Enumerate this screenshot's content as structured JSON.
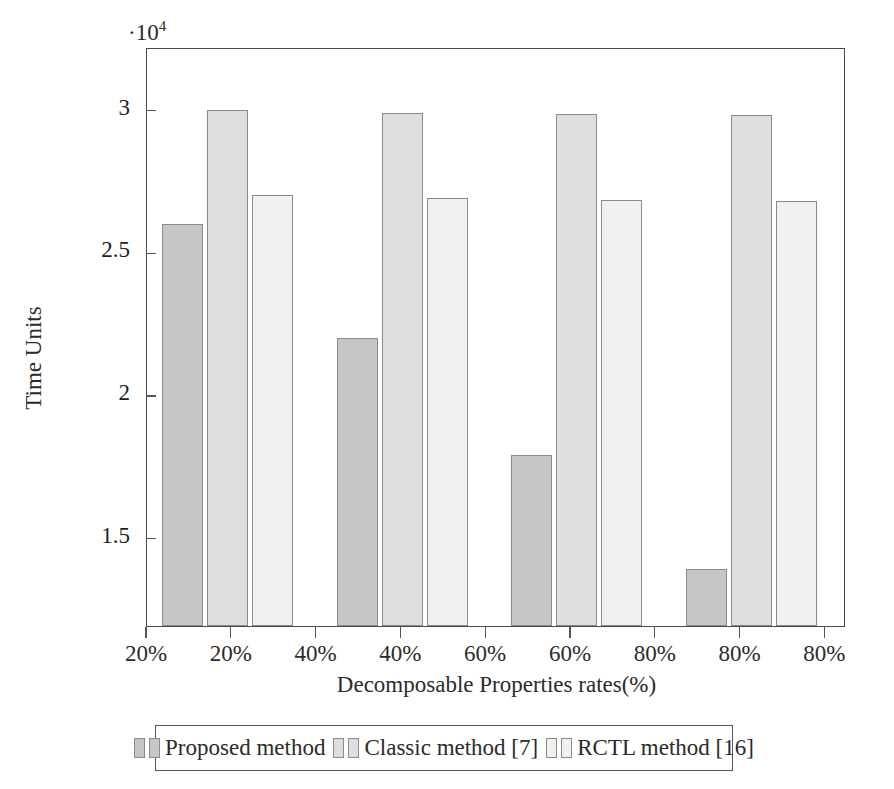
{
  "chart_data": {
    "type": "bar",
    "title": "",
    "xlabel": "Decomposable Properties rates(%)",
    "ylabel": "Time Units",
    "y_exponent": "·10",
    "y_exponent_sup": "4",
    "ylim": [
      1.19,
      3.22
    ],
    "yticks": [
      3,
      2.5,
      2,
      1.5
    ],
    "ytick_labels": [
      "3",
      "2.5",
      "2",
      "1.5"
    ],
    "xtick_labels": [
      "20%",
      "20%",
      "40%",
      "40%",
      "60%",
      "60%",
      "80%",
      "80%",
      "80%"
    ],
    "categories": [
      "20%",
      "40%",
      "60%",
      "80%"
    ],
    "grid": false,
    "legend_position": "below-axes",
    "series": [
      {
        "name": "Proposed method",
        "color": "#c6c6c6",
        "values": [
          2.6,
          2.2,
          1.79,
          1.39
        ]
      },
      {
        "name": "Classic method [7]",
        "color": "#dedede",
        "values": [
          3.0,
          2.99,
          2.985,
          2.98
        ]
      },
      {
        "name": "RCTL method [16]",
        "color": "#f1f1f1",
        "values": [
          2.7,
          2.69,
          2.685,
          2.68
        ]
      }
    ]
  },
  "legend": {
    "entries": [
      {
        "label": "Proposed method"
      },
      {
        "label": "Classic method [7]"
      },
      {
        "label": "RCTL method [16]"
      }
    ]
  }
}
